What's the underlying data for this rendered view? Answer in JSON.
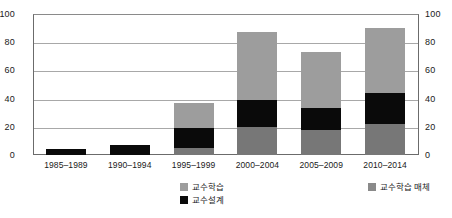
{
  "chart_data": {
    "type": "bar",
    "subtype": "stacked-vertical",
    "title": "",
    "xlabel": "",
    "ylabel": "",
    "ylim": [
      0,
      100
    ],
    "yticks": [
      0,
      20,
      40,
      60,
      80,
      100
    ],
    "y_axis_right": {
      "ylim": [
        0,
        100
      ],
      "yticks": [
        0,
        20,
        40,
        60,
        80,
        100
      ]
    },
    "grid": true,
    "legend_position": "bottom",
    "categories": [
      "1985–1989",
      "1990–1994",
      "1995–1999",
      "2000–2004",
      "2005–2009",
      "2010–2014"
    ],
    "series": [
      {
        "name": "교수학습 매체",
        "color": "#777777",
        "stack_order": 0,
        "values": [
          0,
          0,
          5,
          20,
          18,
          22
        ]
      },
      {
        "name": "교수설계",
        "color": "#0a0a0a",
        "stack_order": 1,
        "values": [
          4,
          7,
          14,
          19,
          15,
          22
        ]
      },
      {
        "name": "교수학습",
        "color": "#9d9d9d",
        "stack_order": 2,
        "values": [
          0,
          0,
          18,
          48,
          40,
          46
        ]
      }
    ],
    "totals": [
      4,
      7,
      37,
      87,
      73,
      90
    ]
  },
  "axis": {
    "left_ticks": [
      "100",
      "80",
      "60",
      "40",
      "20",
      "0"
    ],
    "right_ticks": [
      "100",
      "80",
      "60",
      "40",
      "20",
      "0"
    ]
  },
  "legend": {
    "left_column": [
      {
        "label": "교수학습",
        "swatch": "sw-teach"
      },
      {
        "label": "교수설계",
        "swatch": "sw-design"
      }
    ],
    "right_column": [
      {
        "label": "교수학습 매체",
        "swatch": "sw-media"
      }
    ]
  }
}
